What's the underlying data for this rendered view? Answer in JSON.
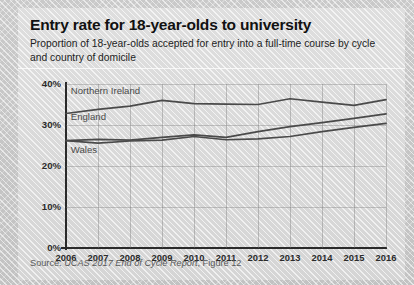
{
  "header": {
    "title": "Entry rate for 18-year-olds to university",
    "subtitle": "Proportion of 18-year-olds accepted for entry into a full-time course by cycle and country of domicile"
  },
  "source": {
    "prefix": "Source: ",
    "italic": "UCAS 2017 End of Cycle Report",
    "suffix": ", Figure 12",
    "full": "Source: UCAS 2017 End of Cycle Report, Figure 12"
  },
  "chart_data": {
    "type": "line",
    "title": "Entry rate for 18-year-olds to university",
    "xlabel": "",
    "ylabel": "",
    "grid": true,
    "legend": "inline-labels",
    "xlim": [
      2006,
      2016
    ],
    "ylim": [
      0,
      40
    ],
    "ytick_labels": [
      "0%",
      "10%",
      "20%",
      "30%",
      "40%"
    ],
    "ytick_values": [
      0,
      10,
      20,
      30,
      40
    ],
    "categories": [
      2006,
      2007,
      2008,
      2009,
      2010,
      2011,
      2012,
      2013,
      2014,
      2015,
      2016
    ],
    "xtick_labels": [
      "2006",
      "2007",
      "2008",
      "2009",
      "2010",
      "2011",
      "2012",
      "2013",
      "2014",
      "2015",
      "2016"
    ],
    "series": [
      {
        "name": "Northern Ireland",
        "color": "#4a4a4a",
        "label_x": 2006.15,
        "label_y": 38.2,
        "values": [
          32.8,
          33.8,
          34.6,
          36.0,
          35.2,
          35.1,
          35.0,
          36.4,
          35.6,
          34.8,
          36.2
        ]
      },
      {
        "name": "England",
        "color": "#4a4a4a",
        "label_x": 2006.15,
        "label_y": 32.0,
        "values": [
          26.2,
          26.5,
          26.3,
          27.0,
          27.6,
          27.0,
          28.4,
          29.6,
          30.6,
          31.6,
          32.7
        ]
      },
      {
        "name": "Wales",
        "color": "#4a4a4a",
        "label_x": 2006.15,
        "label_y": 24.0,
        "values": [
          26.2,
          25.6,
          26.1,
          26.3,
          27.2,
          26.4,
          26.6,
          27.2,
          28.4,
          29.4,
          30.4
        ]
      }
    ]
  }
}
